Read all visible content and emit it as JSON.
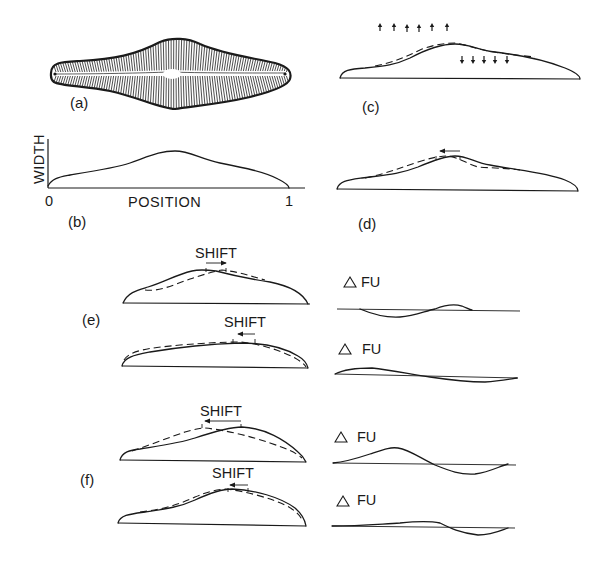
{
  "figure": {
    "panels": {
      "a": {
        "label": "(a)",
        "description": "diatom valve outline drawing"
      },
      "b": {
        "label": "(b)",
        "y_axis_label": "WIDTH",
        "x_axis_label": "POSITION",
        "x_tick_start": "0",
        "x_tick_end": "1"
      },
      "c": {
        "label": "(c)",
        "arrows_up_count": 6,
        "arrows_down_count": 5
      },
      "d": {
        "label": "(d)",
        "shift_direction": "left"
      },
      "e": {
        "label": "(e)",
        "rows": [
          {
            "shift_label": "SHIFT",
            "shift_direction": "right",
            "delta_label": "FU",
            "delta_symbol": "△"
          },
          {
            "shift_label": "SHIFT",
            "shift_direction": "left",
            "delta_label": "FU",
            "delta_symbol": "△"
          }
        ]
      },
      "f": {
        "label": "(f)",
        "rows": [
          {
            "shift_label": "SHIFT",
            "shift_direction": "left",
            "delta_label": "FU",
            "delta_symbol": "△"
          },
          {
            "shift_label": "SHIFT",
            "shift_direction": "left",
            "delta_label": "FU",
            "delta_symbol": "△"
          }
        ]
      }
    },
    "colors": {
      "ink": "#1a1a1a",
      "background": "#ffffff"
    }
  }
}
